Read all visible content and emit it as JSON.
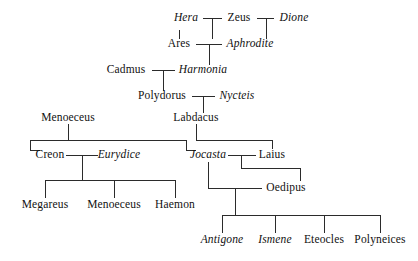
{
  "diagram": {
    "type": "genealogy-tree",
    "background_color": "#ffffff",
    "line_color": "#2b2b2b",
    "text_color": "#111111",
    "style_note": {
      "italic": "female figures",
      "upright": "male figures"
    },
    "people": [
      {
        "id": "hera",
        "label": "Hera",
        "style": "f",
        "x": 186,
        "y": 18
      },
      {
        "id": "zeus",
        "label": "Zeus",
        "style": "m",
        "x": 239,
        "y": 18
      },
      {
        "id": "dione",
        "label": "Dione",
        "style": "f",
        "x": 294,
        "y": 18
      },
      {
        "id": "ares",
        "label": "Ares",
        "style": "m",
        "x": 179,
        "y": 44
      },
      {
        "id": "aphrodite",
        "label": "Aphrodite",
        "style": "f",
        "x": 250,
        "y": 44
      },
      {
        "id": "cadmus",
        "label": "Cadmus",
        "style": "m",
        "x": 126,
        "y": 70
      },
      {
        "id": "harmonia",
        "label": "Harmonia",
        "style": "f",
        "x": 203,
        "y": 70
      },
      {
        "id": "polydorus",
        "label": "Polydorus",
        "style": "m",
        "x": 162,
        "y": 96
      },
      {
        "id": "nycteis",
        "label": "Nycteis",
        "style": "f",
        "x": 237,
        "y": 96
      },
      {
        "id": "menoeceus1",
        "label": "Menoeceus",
        "style": "m",
        "x": 68,
        "y": 118
      },
      {
        "id": "labdacus",
        "label": "Labdacus",
        "style": "m",
        "x": 196,
        "y": 118
      },
      {
        "id": "creon",
        "label": "Creon",
        "style": "m",
        "x": 50,
        "y": 155
      },
      {
        "id": "eurydice",
        "label": "Eurydice",
        "style": "f",
        "x": 119,
        "y": 155
      },
      {
        "id": "jocasta",
        "label": "Jocasta",
        "style": "f",
        "x": 208,
        "y": 155
      },
      {
        "id": "laius",
        "label": "Laius",
        "style": "m",
        "x": 272,
        "y": 155
      },
      {
        "id": "oedipus",
        "label": "Oedipus",
        "style": "m",
        "x": 286,
        "y": 188
      },
      {
        "id": "megareus",
        "label": "Megareus",
        "style": "m",
        "x": 45,
        "y": 205
      },
      {
        "id": "menoeceus2",
        "label": "Menoeceus",
        "style": "m",
        "x": 114,
        "y": 205
      },
      {
        "id": "haemon",
        "label": "Haemon",
        "style": "m",
        "x": 175,
        "y": 205
      },
      {
        "id": "antigone",
        "label": "Antigone",
        "style": "f",
        "x": 222,
        "y": 240
      },
      {
        "id": "ismene",
        "label": "Ismene",
        "style": "f",
        "x": 275,
        "y": 240
      },
      {
        "id": "eteocles",
        "label": "Eteocles",
        "style": "m",
        "x": 324,
        "y": 240
      },
      {
        "id": "polyneices",
        "label": "Polyneices",
        "style": "m",
        "x": 380,
        "y": 240
      }
    ],
    "unions": [
      {
        "id": "hera-zeus",
        "partners": [
          "Hera",
          "Zeus"
        ],
        "children": [
          "Ares"
        ]
      },
      {
        "id": "zeus-dione",
        "partners": [
          "Zeus",
          "Dione"
        ],
        "children": [
          "Aphrodite"
        ]
      },
      {
        "id": "ares-aphrodite",
        "partners": [
          "Ares",
          "Aphrodite"
        ],
        "children": [
          "Harmonia"
        ]
      },
      {
        "id": "cadmus-harmonia",
        "partners": [
          "Cadmus",
          "Harmonia"
        ],
        "children": [
          "Polydorus"
        ]
      },
      {
        "id": "polydorus-nycteis",
        "partners": [
          "Polydorus",
          "Nycteis"
        ],
        "children": [
          "Labdacus"
        ]
      },
      {
        "id": "menoeceus-issue",
        "partners": [
          "Menoeceus"
        ],
        "children": [
          "Creon",
          "Jocasta"
        ]
      },
      {
        "id": "labdacus-issue",
        "partners": [
          "Labdacus"
        ],
        "children": [
          "Laius"
        ]
      },
      {
        "id": "creon-eurydice",
        "partners": [
          "Creon",
          "Eurydice"
        ],
        "children": [
          "Megareus",
          "Menoeceus",
          "Haemon"
        ]
      },
      {
        "id": "jocasta-laius",
        "partners": [
          "Jocasta",
          "Laius"
        ],
        "children": [
          "Oedipus"
        ]
      },
      {
        "id": "jocasta-oedipus",
        "partners": [
          "Jocasta",
          "Oedipus"
        ],
        "children": [
          "Antigone",
          "Ismene",
          "Eteocles",
          "Polyneices"
        ]
      }
    ]
  }
}
